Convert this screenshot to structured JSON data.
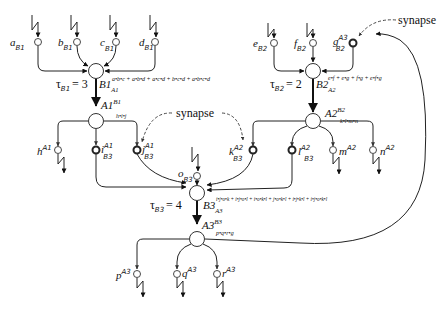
{
  "diagram": {
    "neurons": [
      {
        "id": "B1",
        "label": "B1",
        "sub": "A1",
        "expr": "a•b•c + a•b•d + a•c•d + b•c•d + a•b•c•d",
        "tau_label": "τ",
        "tau_sub": "B1",
        "tau_value": "= 3"
      },
      {
        "id": "B2",
        "label": "B2",
        "sub": "A2",
        "expr": "e•f + e•g + f•g + e•f•g",
        "tau_label": "τ",
        "tau_sub": "B2",
        "tau_value": "= 2"
      },
      {
        "id": "A1",
        "label": "A1",
        "sup": "B1",
        "expr": "h•i•j"
      },
      {
        "id": "A2",
        "label": "A2",
        "sup": "B2",
        "expr": "k•l•m•n"
      },
      {
        "id": "B3",
        "label": "B3",
        "sub": "A3",
        "expr": "i•j•o•k + i•j•o•l + i•o•k•l + j•o•k•l + i•j•k•l + i•j•o•k•l",
        "tau_label": "τ",
        "tau_sub": "B3",
        "tau_value": "= 4"
      },
      {
        "id": "A3",
        "label": "A3",
        "sup": "B3",
        "expr": "p•q•r•g"
      }
    ],
    "synapses": {
      "a": {
        "name": "a",
        "sub": "B1"
      },
      "b": {
        "name": "b",
        "sub": "B1"
      },
      "c": {
        "name": "c",
        "sub": "B1"
      },
      "d": {
        "name": "d",
        "sub": "B1"
      },
      "e": {
        "name": "e",
        "sub": "B2"
      },
      "f": {
        "name": "f",
        "sub": "B2"
      },
      "g": {
        "name": "g",
        "sub": "B2",
        "sup": "A3"
      },
      "h": {
        "name": "h",
        "sup": "A1"
      },
      "i": {
        "name": "i",
        "sub": "B3",
        "sup": "A1"
      },
      "j": {
        "name": "j",
        "sub": "B3",
        "sup": "A1"
      },
      "k": {
        "name": "k",
        "sub": "B3",
        "sup": "A2"
      },
      "l": {
        "name": "l",
        "sub": "B3",
        "sup": "A2"
      },
      "m": {
        "name": "m",
        "sup": "A2"
      },
      "n": {
        "name": "n",
        "sup": "A2"
      },
      "o": {
        "name": "o",
        "sub": "B3"
      },
      "p": {
        "name": "p",
        "sup": "A3"
      },
      "q": {
        "name": "q",
        "sup": "A3"
      },
      "r": {
        "name": "r",
        "sup": "A3"
      }
    },
    "annotations": {
      "synapse_top_right": "synapse",
      "synapse_middle": "synapse"
    }
  }
}
